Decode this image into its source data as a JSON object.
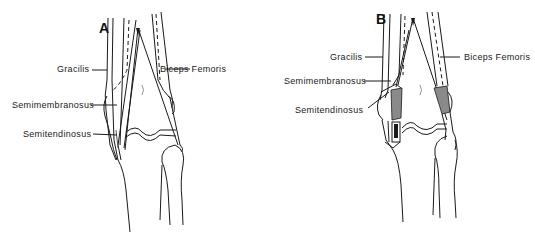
{
  "figure": {
    "panels": [
      {
        "id": "A",
        "letter": "A",
        "labels": {
          "gracilis": "Gracilis",
          "semimembranosus": "Semimembranosus",
          "semitendinosus": "Semitendinosus",
          "biceps_femoris": "Biceps Femoris"
        }
      },
      {
        "id": "B",
        "letter": "B",
        "labels": {
          "gracilis": "Gracilis",
          "semimembranosus": "Semimembranosus",
          "semitendinosus": "Semitendinosus",
          "biceps_femoris": "Biceps Femoris"
        }
      }
    ],
    "colors": {
      "line": "#1a1a1a",
      "background": "#ffffff",
      "shading": "#8a8a8a"
    }
  }
}
